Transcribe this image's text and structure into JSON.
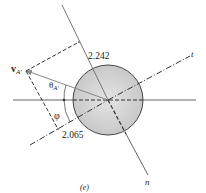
{
  "figure": {
    "caption": "(e)",
    "labels": {
      "velocity": "v",
      "velocity_sub": "A′",
      "theta": "θ",
      "theta_sub": "A′",
      "phi": "φ",
      "n_component": "2.242",
      "t_component": "2.065",
      "n_axis": "n",
      "t_axis": "t"
    },
    "colors": {
      "ball_fill": "#cfcfcf",
      "ball_stroke": "#444444",
      "line": "#666666",
      "dashed": "#333333",
      "vector": "#888888"
    }
  }
}
